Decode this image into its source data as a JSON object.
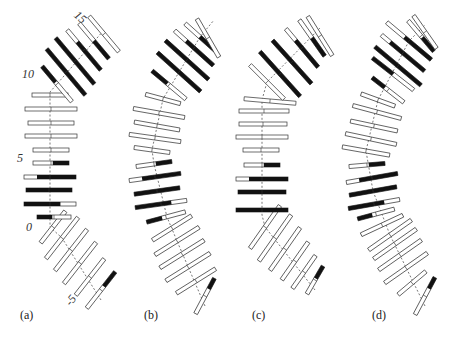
{
  "figure": {
    "panels": [
      {
        "id": "a",
        "label": "(a)",
        "label_pos": [
          20,
          318
        ]
      },
      {
        "id": "b",
        "label": "(b)",
        "label_pos": [
          144,
          318
        ]
      },
      {
        "id": "c",
        "label": "(c)",
        "label_pos": [
          252,
          318
        ]
      },
      {
        "id": "d",
        "label": "(d)",
        "label_pos": [
          372,
          318
        ]
      }
    ],
    "index_labels": [
      {
        "text": "15",
        "x": 74,
        "y": 20,
        "rot": 40
      },
      {
        "text": "10",
        "x": 22,
        "y": 77,
        "rot": 0
      },
      {
        "text": "5",
        "x": 17,
        "y": 161,
        "rot": 0
      },
      {
        "text": "0",
        "x": 26,
        "y": 230,
        "rot": 0
      },
      {
        "text": "-5",
        "x": 66,
        "y": 303,
        "rot": -50
      }
    ],
    "colors": {
      "outline": "#333333",
      "fill_dark": "#111111",
      "fill_light": "#ffffff",
      "axis": "#555555"
    },
    "bar_thickness": 4,
    "bars": {
      "a": [
        {
          "x": 101,
          "y": 290,
          "a": -52,
          "l": 46,
          "d": [
            0.6,
            1
          ]
        },
        {
          "x": 90,
          "y": 277,
          "a": -52,
          "l": 46,
          "d": null
        },
        {
          "x": 80,
          "y": 263,
          "a": -52,
          "l": 52,
          "d": null
        },
        {
          "x": 71,
          "y": 250,
          "a": -52,
          "l": 52,
          "d": null
        },
        {
          "x": 62,
          "y": 238,
          "a": -52,
          "l": 52,
          "d": null
        },
        {
          "x": 53,
          "y": 227,
          "a": -52,
          "l": 40,
          "d": null
        },
        {
          "x": 54,
          "y": 217,
          "a": 0,
          "l": 34,
          "d": [
            0,
            0.45
          ]
        },
        {
          "x": 50,
          "y": 204,
          "a": 0,
          "l": 52,
          "d": [
            0,
            0.7
          ]
        },
        {
          "x": 49,
          "y": 190,
          "a": 0,
          "l": 46,
          "d": [
            0,
            1
          ]
        },
        {
          "x": 50,
          "y": 177,
          "a": 0,
          "l": 52,
          "d": [
            0.25,
            1
          ]
        },
        {
          "x": 51,
          "y": 163,
          "a": 0,
          "l": 36,
          "d": [
            0.55,
            1
          ]
        },
        {
          "x": 51,
          "y": 150,
          "a": 0,
          "l": 36,
          "d": null
        },
        {
          "x": 51,
          "y": 136,
          "a": 0,
          "l": 52,
          "d": null
        },
        {
          "x": 51,
          "y": 123,
          "a": 0,
          "l": 46,
          "d": null
        },
        {
          "x": 51,
          "y": 109,
          "a": 0,
          "l": 52,
          "d": null
        },
        {
          "x": 50,
          "y": 95,
          "a": 0,
          "l": 36,
          "d": null
        },
        {
          "x": 57,
          "y": 84,
          "a": 50,
          "l": 46,
          "d": [
            0,
            0.45
          ]
        },
        {
          "x": 66,
          "y": 72,
          "a": 50,
          "l": 60,
          "d": [
            0,
            1
          ]
        },
        {
          "x": 75,
          "y": 61,
          "a": 50,
          "l": 60,
          "d": [
            0,
            1
          ]
        },
        {
          "x": 84,
          "y": 50,
          "a": 50,
          "l": 52,
          "d": [
            0.3,
            1
          ]
        },
        {
          "x": 94,
          "y": 41,
          "a": 50,
          "l": 46,
          "d": [
            0.5,
            1
          ]
        },
        {
          "x": 104,
          "y": 34,
          "a": 50,
          "l": 46,
          "d": null
        }
      ],
      "b": [
        {
          "x": 205,
          "y": 296,
          "a": -62,
          "l": 40,
          "d": [
            0.7,
            1
          ]
        },
        {
          "x": 196,
          "y": 281,
          "a": -32,
          "l": 46,
          "d": null
        },
        {
          "x": 188,
          "y": 267,
          "a": -32,
          "l": 52,
          "d": null
        },
        {
          "x": 182,
          "y": 254,
          "a": -32,
          "l": 52,
          "d": null
        },
        {
          "x": 177,
          "y": 241,
          "a": -32,
          "l": 52,
          "d": null
        },
        {
          "x": 172,
          "y": 228,
          "a": -32,
          "l": 46,
          "d": null
        },
        {
          "x": 166,
          "y": 217,
          "a": -15,
          "l": 40,
          "d": [
            0,
            0.4
          ]
        },
        {
          "x": 161,
          "y": 204,
          "a": -8,
          "l": 52,
          "d": [
            0,
            0.7
          ]
        },
        {
          "x": 157,
          "y": 191,
          "a": -8,
          "l": 46,
          "d": [
            0,
            1
          ]
        },
        {
          "x": 155,
          "y": 177,
          "a": -8,
          "l": 52,
          "d": [
            0.25,
            1
          ]
        },
        {
          "x": 154,
          "y": 164,
          "a": -8,
          "l": 36,
          "d": [
            0.55,
            1
          ]
        },
        {
          "x": 152,
          "y": 150,
          "a": 8,
          "l": 36,
          "d": null
        },
        {
          "x": 155,
          "y": 138,
          "a": 8,
          "l": 52,
          "d": null
        },
        {
          "x": 157,
          "y": 126,
          "a": 10,
          "l": 46,
          "d": null
        },
        {
          "x": 159,
          "y": 113,
          "a": 10,
          "l": 52,
          "d": null
        },
        {
          "x": 163,
          "y": 99,
          "a": 15,
          "l": 36,
          "d": null
        },
        {
          "x": 169,
          "y": 85,
          "a": 40,
          "l": 44,
          "d": [
            0,
            0.45
          ]
        },
        {
          "x": 179,
          "y": 72,
          "a": 42,
          "l": 58,
          "d": [
            0,
            1
          ]
        },
        {
          "x": 187,
          "y": 60,
          "a": 42,
          "l": 58,
          "d": [
            0,
            1
          ]
        },
        {
          "x": 194,
          "y": 48,
          "a": 42,
          "l": 52,
          "d": [
            0.3,
            1
          ]
        },
        {
          "x": 200,
          "y": 37,
          "a": 42,
          "l": 40,
          "d": [
            0.5,
            1
          ]
        },
        {
          "x": 208,
          "y": 38,
          "a": 60,
          "l": 44,
          "d": null
        }
      ],
      "c": [
        {
          "x": 315,
          "y": 280,
          "a": -60,
          "l": 32,
          "d": [
            0.55,
            1
          ]
        },
        {
          "x": 304,
          "y": 272,
          "a": -55,
          "l": 40,
          "d": null
        },
        {
          "x": 295,
          "y": 261,
          "a": -55,
          "l": 46,
          "d": null
        },
        {
          "x": 285,
          "y": 249,
          "a": -55,
          "l": 52,
          "d": null
        },
        {
          "x": 275,
          "y": 238,
          "a": -55,
          "l": 56,
          "d": null
        },
        {
          "x": 265,
          "y": 227,
          "a": -55,
          "l": 52,
          "d": null
        },
        {
          "x": 262,
          "y": 210,
          "a": 0,
          "l": 52,
          "d": [
            0,
            1
          ]
        },
        {
          "x": 262,
          "y": 192,
          "a": 0,
          "l": 48,
          "d": [
            0,
            1
          ]
        },
        {
          "x": 262,
          "y": 179,
          "a": 0,
          "l": 52,
          "d": [
            0.25,
            1
          ]
        },
        {
          "x": 262,
          "y": 165,
          "a": 0,
          "l": 36,
          "d": [
            0.55,
            1
          ]
        },
        {
          "x": 261,
          "y": 150,
          "a": 0,
          "l": 36,
          "d": null
        },
        {
          "x": 262,
          "y": 137,
          "a": 0,
          "l": 52,
          "d": null
        },
        {
          "x": 263,
          "y": 124,
          "a": 0,
          "l": 48,
          "d": null
        },
        {
          "x": 264,
          "y": 111,
          "a": 0,
          "l": 50,
          "d": null
        },
        {
          "x": 270,
          "y": 101,
          "a": 5,
          "l": 52,
          "d": null
        },
        {
          "x": 267,
          "y": 82,
          "a": 45,
          "l": 48,
          "d": null
        },
        {
          "x": 280,
          "y": 74,
          "a": 48,
          "l": 60,
          "d": [
            0,
            1
          ]
        },
        {
          "x": 292,
          "y": 62,
          "a": 48,
          "l": 58,
          "d": [
            0,
            1
          ]
        },
        {
          "x": 302,
          "y": 48,
          "a": 50,
          "l": 50,
          "d": [
            0.3,
            1
          ]
        },
        {
          "x": 312,
          "y": 38,
          "a": 55,
          "l": 44,
          "d": [
            0.5,
            1
          ]
        },
        {
          "x": 320,
          "y": 36,
          "a": 58,
          "l": 46,
          "d": null
        }
      ],
      "d": [
        {
          "x": 425,
          "y": 296,
          "a": -62,
          "l": 42,
          "d": [
            0.7,
            1
          ]
        },
        {
          "x": 412,
          "y": 283,
          "a": -40,
          "l": 36,
          "d": null
        },
        {
          "x": 406,
          "y": 268,
          "a": -35,
          "l": 52,
          "d": null
        },
        {
          "x": 400,
          "y": 255,
          "a": -35,
          "l": 52,
          "d": null
        },
        {
          "x": 395,
          "y": 244,
          "a": -35,
          "l": 52,
          "d": null
        },
        {
          "x": 390,
          "y": 235,
          "a": -35,
          "l": 52,
          "d": null
        },
        {
          "x": 382,
          "y": 225,
          "a": -25,
          "l": 46,
          "d": null
        },
        {
          "x": 376,
          "y": 214,
          "a": -15,
          "l": 38,
          "d": [
            0,
            0.4
          ]
        },
        {
          "x": 374,
          "y": 204,
          "a": -10,
          "l": 52,
          "d": [
            0,
            0.7
          ]
        },
        {
          "x": 373,
          "y": 191,
          "a": -10,
          "l": 48,
          "d": [
            0,
            1
          ]
        },
        {
          "x": 372,
          "y": 178,
          "a": -10,
          "l": 52,
          "d": [
            0.25,
            1
          ]
        },
        {
          "x": 367,
          "y": 165,
          "a": -5,
          "l": 36,
          "d": [
            0.55,
            1
          ]
        },
        {
          "x": 366,
          "y": 151,
          "a": 10,
          "l": 48,
          "d": null
        },
        {
          "x": 371,
          "y": 139,
          "a": 12,
          "l": 52,
          "d": null
        },
        {
          "x": 374,
          "y": 126,
          "a": 12,
          "l": 48,
          "d": null
        },
        {
          "x": 377,
          "y": 112,
          "a": 15,
          "l": 50,
          "d": null
        },
        {
          "x": 378,
          "y": 100,
          "a": 20,
          "l": 36,
          "d": null
        },
        {
          "x": 388,
          "y": 90,
          "a": 38,
          "l": 40,
          "d": [
            0,
            0.4
          ]
        },
        {
          "x": 393,
          "y": 74,
          "a": 38,
          "l": 52,
          "d": [
            0,
            0.5
          ]
        },
        {
          "x": 398,
          "y": 66,
          "a": 40,
          "l": 60,
          "d": [
            0,
            1
          ]
        },
        {
          "x": 403,
          "y": 53,
          "a": 40,
          "l": 56,
          "d": [
            0.2,
            1
          ]
        },
        {
          "x": 409,
          "y": 41,
          "a": 40,
          "l": 58,
          "d": [
            0.4,
            1
          ]
        },
        {
          "x": 421,
          "y": 36,
          "a": 50,
          "l": 40,
          "d": [
            0.55,
            1
          ]
        },
        {
          "x": 425,
          "y": 32,
          "a": 55,
          "l": 40,
          "d": null
        }
      ]
    },
    "axes": {
      "a": [
        [
          101,
          300
        ],
        [
          62,
          238
        ],
        [
          50,
          227
        ],
        [
          50,
          92
        ],
        [
          57,
          84
        ],
        [
          104,
          30
        ]
      ],
      "b": [
        [
          205,
          306
        ],
        [
          177,
          241
        ],
        [
          167,
          217
        ],
        [
          154,
          164
        ],
        [
          152,
          150
        ],
        [
          163,
          99
        ],
        [
          200,
          37
        ],
        [
          214,
          20
        ]
      ],
      "c": [
        [
          315,
          290
        ],
        [
          265,
          227
        ],
        [
          262,
          215
        ],
        [
          262,
          100
        ],
        [
          267,
          82
        ],
        [
          320,
          28
        ]
      ],
      "d": [
        [
          425,
          306
        ],
        [
          390,
          235
        ],
        [
          373,
          191
        ],
        [
          366,
          151
        ],
        [
          378,
          100
        ],
        [
          409,
          41
        ],
        [
          425,
          25
        ]
      ]
    }
  }
}
